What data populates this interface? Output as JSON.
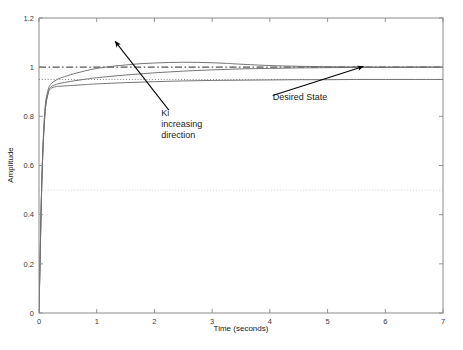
{
  "chart_data": {
    "type": "line",
    "title": "",
    "xlabel": "Time (seconds)",
    "ylabel": "Amplitude",
    "xlim": [
      0,
      7
    ],
    "ylim": [
      0,
      1.2
    ],
    "xticks": [
      "0",
      "1",
      "2",
      "3",
      "4",
      "5",
      "6",
      "7"
    ],
    "xtick_values": [
      0,
      1,
      2,
      3,
      4,
      5,
      6,
      7
    ],
    "yticks": [
      "0",
      "0.2",
      "0.4",
      "0.6",
      "0.8",
      "1",
      "1.2"
    ],
    "ytick_values": [
      0,
      0.2,
      0.4,
      0.6,
      0.8,
      1,
      1.2
    ],
    "grid": false,
    "legend": "none",
    "reference_lines": [
      {
        "name": "desired-state-line",
        "value": 1.0,
        "style": "dash-dot",
        "color": "#555555",
        "label": "Desired State"
      },
      {
        "name": "settling-band-line",
        "value": 0.95,
        "style": "dotted",
        "color": "#777777",
        "label": ""
      },
      {
        "name": "mid-reference-line",
        "value": 0.5,
        "style": "dotted",
        "color": "#cccccc",
        "label": ""
      }
    ],
    "series": [
      {
        "name": "Ki low",
        "color": "#6e6e6e",
        "style": "solid",
        "x": [
          0,
          0.05,
          0.1,
          0.15,
          0.2,
          0.3,
          0.4,
          0.6,
          0.8,
          1.0,
          1.5,
          2.0,
          2.5,
          3.0,
          3.5,
          4.0,
          4.5,
          5.0,
          5.5,
          6.0,
          6.5,
          7.0
        ],
        "values": [
          0,
          0.54,
          0.8,
          0.885,
          0.912,
          0.921,
          0.923,
          0.926,
          0.929,
          0.932,
          0.937,
          0.941,
          0.944,
          0.946,
          0.947,
          0.948,
          0.949,
          0.949,
          0.95,
          0.95,
          0.95,
          0.95
        ]
      },
      {
        "name": "Ki medium",
        "color": "#6e6e6e",
        "style": "solid",
        "x": [
          0,
          0.05,
          0.1,
          0.15,
          0.2,
          0.3,
          0.4,
          0.6,
          0.8,
          1.0,
          1.5,
          2.0,
          2.5,
          3.0,
          3.5,
          4.0,
          4.5,
          5.0,
          5.5,
          6.0,
          6.5,
          7.0
        ],
        "values": [
          0,
          0.54,
          0.8,
          0.888,
          0.918,
          0.93,
          0.936,
          0.944,
          0.951,
          0.957,
          0.968,
          0.977,
          0.984,
          0.989,
          0.993,
          0.995,
          0.997,
          0.998,
          0.999,
          0.999,
          1.0,
          1.0
        ]
      },
      {
        "name": "Ki high",
        "color": "#6e6e6e",
        "style": "solid",
        "x": [
          0,
          0.05,
          0.1,
          0.15,
          0.2,
          0.3,
          0.4,
          0.6,
          0.8,
          1.0,
          1.25,
          1.5,
          1.75,
          2.0,
          2.25,
          2.5,
          2.75,
          3.0,
          3.25,
          3.5,
          4.0,
          4.5,
          5.0,
          5.5,
          6.0,
          6.5,
          7.0
        ],
        "values": [
          0,
          0.55,
          0.82,
          0.9,
          0.93,
          0.948,
          0.958,
          0.973,
          0.985,
          0.995,
          1.003,
          1.009,
          1.014,
          1.017,
          1.019,
          1.02,
          1.0195,
          1.018,
          1.0155,
          1.012,
          1.0065,
          1.0035,
          1.0018,
          1.0008,
          1.0003,
          1.0001,
          1.0
        ]
      }
    ],
    "annotations": [
      {
        "name": "ki-increasing-annotation",
        "lines": [
          "Ki",
          "increasing",
          "direction"
        ],
        "text_x": 2.12,
        "text_y": 0.8,
        "arrow_tail_x": 2.25,
        "arrow_tail_y": 0.825,
        "arrow_head_x": 1.32,
        "arrow_head_y": 1.105
      },
      {
        "name": "desired-state-annotation",
        "lines": [
          "Desired State"
        ],
        "text_x": 4.05,
        "text_y": 0.865,
        "arrow_tail_x": 4.05,
        "arrow_tail_y": 0.885,
        "arrow_head_x": 5.62,
        "arrow_head_y": 1.003
      }
    ]
  }
}
